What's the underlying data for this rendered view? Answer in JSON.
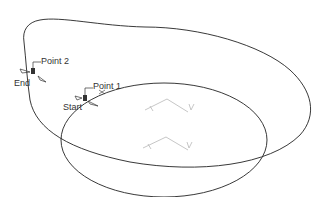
{
  "diagram": {
    "labels": {
      "point2": "Point 2",
      "end": "End",
      "point1": "Point 1",
      "start": "Start"
    },
    "colors": {
      "curve": "#222222",
      "axis": "#b8b8b8",
      "background": "#ffffff"
    },
    "axis_triads": [
      {
        "name": "upper-axis-triad",
        "x_label": "X",
        "y_label": "Y"
      },
      {
        "name": "lower-axis-triad",
        "x_label": "X",
        "y_label": "Y"
      }
    ]
  }
}
